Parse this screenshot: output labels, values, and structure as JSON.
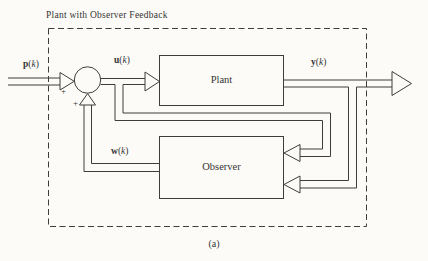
{
  "colors": {
    "ink": "#3d3d3d",
    "paper": "#fcfbf7"
  },
  "figure": {
    "title": "Plant with Observer Feedback",
    "caption": "(a)",
    "blocks": {
      "plant": "Plant",
      "observer": "Observer"
    },
    "summer": {
      "input_sign": "+",
      "feedback_sign": "+"
    },
    "notation": {
      "open": "(",
      "close": ")"
    },
    "signals": {
      "reference": {
        "name": "p",
        "index": "k"
      },
      "control": {
        "name": "u",
        "index": "k"
      },
      "output": {
        "name": "y",
        "index": "k"
      },
      "estimate": {
        "name": "w",
        "index": "k"
      }
    }
  }
}
